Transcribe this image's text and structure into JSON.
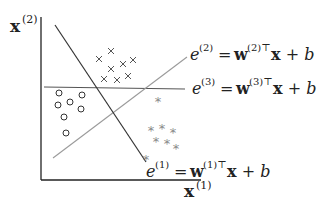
{
  "diagram": {
    "type": "multi-class linear decision boundaries",
    "axes": {
      "x_label": "x",
      "x_sup": "(1)",
      "y_label": "x",
      "y_sup": "(2)"
    },
    "lines": [
      {
        "id": "e1",
        "label_e": "e",
        "label_sup": "(1)",
        "label_rhs": " = w",
        "rhs_sup": "(1)⊤",
        "rhs_tail": "x + b",
        "color": "#333333"
      },
      {
        "id": "e2",
        "label_e": "e",
        "label_sup": "(2)",
        "label_rhs": " = w",
        "rhs_sup": "(2)⊤",
        "rhs_tail": "x + b",
        "color": "#999999"
      },
      {
        "id": "e3",
        "label_e": "e",
        "label_sup": "(3)",
        "label_rhs": " = w",
        "rhs_sup": "(3)⊤",
        "rhs_tail": "x + b",
        "color": "#555555"
      }
    ],
    "classes": [
      {
        "name": "circles",
        "marker": "○",
        "count": 7
      },
      {
        "name": "crosses",
        "marker": "×",
        "count": 8
      },
      {
        "name": "stars",
        "marker": "*",
        "count": 8
      }
    ]
  }
}
